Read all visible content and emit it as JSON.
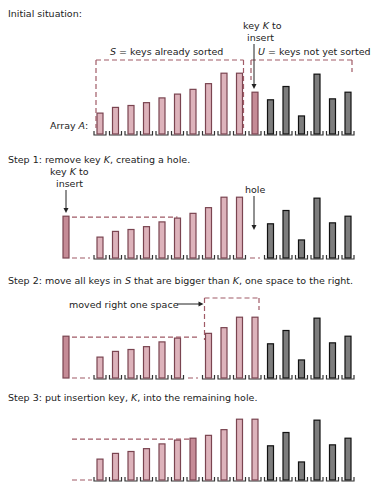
{
  "colors": {
    "sorted_fill": "#ddb3bb",
    "sorted_stroke": "#7a4450",
    "key_fill": "#c58b96",
    "unsorted_fill": "#7d7d7d",
    "unsorted_stroke": "#111111",
    "dash": "#a05a66",
    "slot": "#333333"
  },
  "sections": [
    {
      "id": "initial",
      "title": "Initial situation:"
    },
    {
      "id": "step1",
      "title": "Step 1: remove key K, creating a hole."
    },
    {
      "id": "step2",
      "title": "Step 2: move all keys in S that are bigger than K, one space to the right."
    },
    {
      "id": "step3",
      "title": "Step 3: put insertion key, K, into the remaining hole."
    }
  ],
  "annotations": {
    "sorted_label": "S = keys already sorted",
    "unsorted_label": "U = keys not yet sorted",
    "key_to_insert_1": "key K to",
    "key_to_insert_2": "insert",
    "array_label": "Array A:",
    "hole": "hole",
    "moved": "moved right one space"
  },
  "chart_data": {
    "type": "bar",
    "sorted_keys": [
      22,
      28,
      30,
      33,
      38,
      42,
      47,
      53,
      64,
      64
    ],
    "key_K": 44,
    "unsorted_keys": [
      44,
      36,
      50,
      19,
      63,
      37,
      44
    ],
    "initial_array": [
      22,
      28,
      30,
      33,
      38,
      42,
      47,
      53,
      64,
      64,
      44,
      44,
      36,
      50,
      19,
      63,
      37,
      44
    ],
    "step3_array": [
      22,
      28,
      30,
      33,
      38,
      42,
      44,
      47,
      53,
      64,
      64,
      44,
      36,
      50,
      19,
      63,
      37,
      44
    ]
  }
}
